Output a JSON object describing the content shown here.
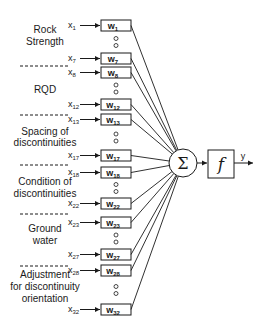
{
  "diagram": {
    "type": "neural-network-neuron",
    "groups": [
      {
        "label_lines": [
          "Rock",
          "Strength"
        ],
        "inputs": [
          "1",
          "7"
        ]
      },
      {
        "label_lines": [
          "RQD"
        ],
        "inputs": [
          "8",
          "12"
        ]
      },
      {
        "label_lines": [
          "Spacing of",
          "discontinuities"
        ],
        "inputs": [
          "13",
          "17"
        ]
      },
      {
        "label_lines": [
          "Condition of",
          "discontinuities"
        ],
        "inputs": [
          "18",
          "22"
        ]
      },
      {
        "label_lines": [
          "Ground",
          "water"
        ],
        "inputs": [
          "23",
          "27"
        ]
      },
      {
        "label_lines": [
          "Adjustment",
          "for discontinuity",
          "orientation"
        ],
        "inputs": [
          "28",
          "32"
        ]
      }
    ],
    "input_prefix": "x",
    "weight_prefix": "w",
    "summation_symbol": "Σ",
    "activation_symbol": "f",
    "output_label": "y",
    "colors": {
      "stroke": "#1a1a1a",
      "background": "#ffffff"
    }
  }
}
